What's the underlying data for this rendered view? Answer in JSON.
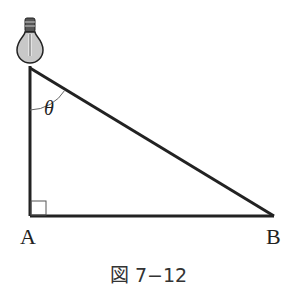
{
  "figure": {
    "caption": "図 7−12",
    "points": {
      "A": {
        "label": "A",
        "x": 30,
        "y": 216
      },
      "B": {
        "label": "B",
        "x": 273,
        "y": 216
      },
      "top": {
        "x": 30,
        "y": 68
      }
    },
    "angle_label": "θ",
    "right_angle_at": "A",
    "light_source": "light-bulb",
    "colors": {
      "line": "#222222",
      "bulb_fill": "#c8c8c8",
      "angle_arc": "#666666"
    }
  }
}
